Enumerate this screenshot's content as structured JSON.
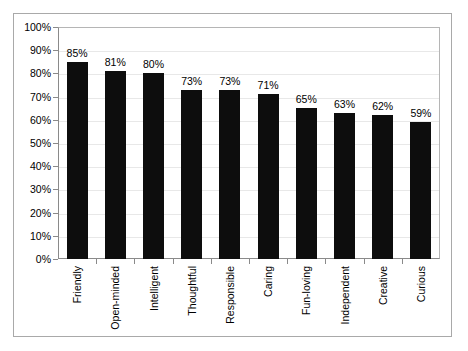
{
  "chart_data": {
    "type": "bar",
    "title": "",
    "subtitle": "",
    "xlabel": "",
    "ylabel": "",
    "ylim": [
      0,
      100
    ],
    "y_tick_labels": [
      "100%",
      "90%",
      "80%",
      "70%",
      "60%",
      "50%",
      "40%",
      "30%",
      "20%",
      "10%",
      "0%"
    ],
    "y_tick_values": [
      100,
      90,
      80,
      70,
      60,
      50,
      40,
      30,
      20,
      10,
      0
    ],
    "grid": true,
    "legend": false,
    "legend_position": "none",
    "bar_color": "#0d0d0d",
    "categories": [
      "Friendly",
      "Open-minded",
      "Intelligent",
      "Thoughtful",
      "Responsible",
      "Caring",
      "Fun-loving",
      "Independent",
      "Creative",
      "Curious"
    ],
    "values": [
      85,
      81,
      80,
      73,
      73,
      71,
      65,
      63,
      62,
      59
    ],
    "data_labels": [
      "85%",
      "81%",
      "80%",
      "73%",
      "73%",
      "71%",
      "65%",
      "63%",
      "62%",
      "59%"
    ]
  },
  "colors": {
    "bar": "#0d0d0d",
    "outer_border": "#a9a9a9",
    "plot_border": "#8a8a8a",
    "gridline": "#e8e8e8",
    "background": "#ffffff",
    "text": "#000000"
  }
}
